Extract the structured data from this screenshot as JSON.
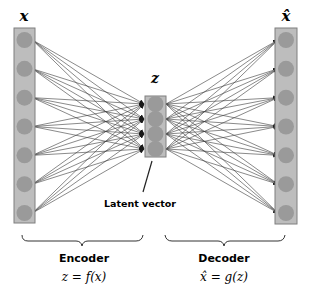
{
  "diagram": {
    "type": "autoencoder",
    "input_label": "x",
    "latent_label": "z",
    "output_label": "x̂",
    "latent_caption": "Latent vector",
    "encoder": {
      "title": "Encoder",
      "formula": "z = f(x)"
    },
    "decoder": {
      "title": "Decoder",
      "formula": "x̂ = g(z)"
    },
    "input_nodes": 7,
    "latent_nodes": 4,
    "output_nodes": 7
  },
  "colors": {
    "column_fill": "#bdbdbd",
    "column_border": "#7f7f7f",
    "node_fill": "#9a9a9a",
    "edge": "#3a3a3a",
    "text": "#000000"
  }
}
